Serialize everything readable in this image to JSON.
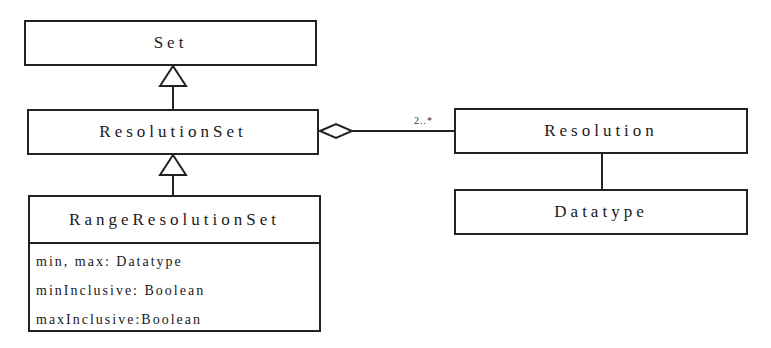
{
  "diagram": {
    "type": "UML class diagram",
    "classes": {
      "set": {
        "name": "Set"
      },
      "resolution_set": {
        "name": "ResolutionSet"
      },
      "range_resolution_set": {
        "name": "RangeResolutionSet",
        "attributes": [
          "min, max: Datatype",
          "minInclusive: Boolean",
          "maxInclusive:Boolean"
        ]
      },
      "resolution": {
        "name": "Resolution"
      },
      "datatype": {
        "name": "Datatype"
      }
    },
    "relationships": [
      {
        "type": "generalization",
        "from": "ResolutionSet",
        "to": "Set"
      },
      {
        "type": "generalization",
        "from": "RangeResolutionSet",
        "to": "ResolutionSet"
      },
      {
        "type": "aggregation",
        "whole": "ResolutionSet",
        "part": "Resolution",
        "multiplicity": "2..*"
      },
      {
        "type": "association",
        "from": "Resolution",
        "to": "Datatype"
      }
    ],
    "aggregation_multiplicity": "2..*",
    "colors": {
      "line": "#222222",
      "background": "#ffffff"
    }
  }
}
